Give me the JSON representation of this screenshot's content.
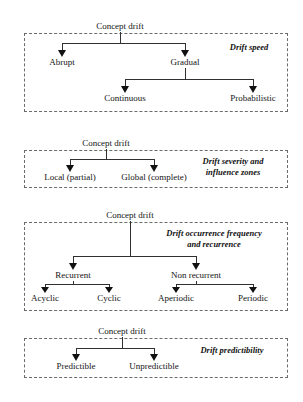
{
  "figure": {
    "type": "taxonomy-tree-diagram",
    "root_label": "Concept drift",
    "groups": [
      {
        "id": "drift-speed",
        "caption": "Drift speed",
        "caption_lines": [
          "Drift speed"
        ],
        "root": "Concept drift",
        "level1": [
          "Abrupt",
          "Gradual"
        ],
        "level2_parent": "Gradual",
        "level2": [
          "Continuous",
          "Probabilistic"
        ]
      },
      {
        "id": "drift-severity",
        "caption": "Drift severity and influence zones",
        "caption_lines": [
          "Drift severity and",
          "influence zones"
        ],
        "root": "Concept drift",
        "level1": [
          "Local (partial)",
          "Global (complete)"
        ],
        "level2_parent": "",
        "level2": []
      },
      {
        "id": "drift-occurrence",
        "caption": "Drift occurrence frequency and recurrence",
        "caption_lines": [
          "Drift occurrence frequency",
          "and recurrence"
        ],
        "root": "Concept drift",
        "level1": [
          "Recurrent",
          "Non recurrent"
        ],
        "level2_recurrent": [
          "Acyclic",
          "Cyclic"
        ],
        "level2_nonrecurrent": [
          "Aperiodic",
          "Periodic"
        ]
      },
      {
        "id": "drift-predictability",
        "caption": "Drift predictibility",
        "caption_lines": [
          "Drift predictibility"
        ],
        "root": "Concept drift",
        "level1": [
          "Predictible",
          "Unpredictible"
        ],
        "level2": []
      }
    ]
  },
  "colors": {
    "background": "#ffffff",
    "text": "#141414",
    "connector": "#303030",
    "dashed_border": "#6b6b6b"
  }
}
